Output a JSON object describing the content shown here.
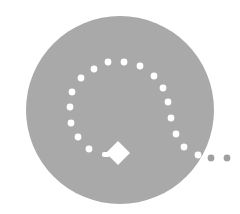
{
  "graphic": {
    "name": "route-path-icon",
    "background": "#ffffff",
    "circle": {
      "cx": 120,
      "cy": 110,
      "r": 94,
      "fill": "#a9a9a9"
    },
    "path_dots_inside": [
      [
        89,
        149
      ],
      [
        78,
        137
      ],
      [
        71,
        123
      ],
      [
        70,
        107
      ],
      [
        72,
        92
      ],
      [
        81,
        78
      ],
      [
        94,
        69
      ],
      [
        108,
        62
      ],
      [
        124,
        62
      ],
      [
        140,
        66
      ],
      [
        154,
        76
      ],
      [
        163,
        88
      ],
      [
        168,
        102
      ],
      [
        171,
        118
      ],
      [
        176,
        134
      ],
      [
        184,
        147
      ],
      [
        198,
        155
      ]
    ],
    "path_dots_outside": [
      [
        211,
        158
      ],
      [
        227,
        158
      ]
    ],
    "dot_colors": {
      "inside": "#ffffff",
      "outside": "#a0a0a0"
    },
    "dot_radius": 3.4,
    "marker": {
      "shape": "diamond-pin",
      "cx": 118,
      "cy": 153,
      "half": 12,
      "fill": "#ffffff"
    }
  }
}
